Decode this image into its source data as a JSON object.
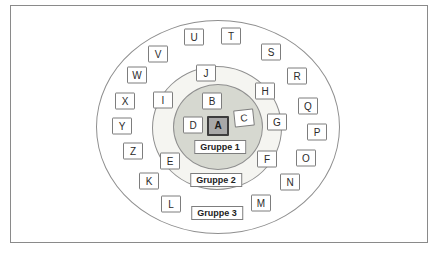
{
  "diagram": {
    "type": "concentric-group-diagram",
    "colors": {
      "page_background": "#ffffff",
      "frame_border": "#8a8a8a",
      "circle_stroke": "#8f8f8f",
      "node_border": "#7d7d7d",
      "node_fill": "#ffffff",
      "center_node_fill": "#a8a8a8",
      "center_node_border": "#3d3d3d",
      "inner_circle_fill": "#d6d8d0",
      "middle_circle_fill": "#f5f5f1",
      "outer_circle_fill": "#ffffff"
    },
    "circles": [
      {
        "name": "outer-ellipse",
        "cx": 218,
        "cy": 127,
        "rx": 122,
        "ry": 107,
        "fill": "#ffffff"
      },
      {
        "name": "middle-ellipse",
        "cx": 217,
        "cy": 128,
        "rx": 65,
        "ry": 62,
        "fill": "#f5f5f1"
      },
      {
        "name": "inner-ellipse",
        "cx": 218,
        "cy": 127,
        "rx": 45,
        "ry": 43,
        "fill": "#d6d8d0"
      }
    ],
    "nodes": [
      {
        "label": "A",
        "x": 218,
        "y": 126,
        "ring": 1,
        "variant": "center"
      },
      {
        "label": "B",
        "x": 212,
        "y": 101,
        "ring": 1,
        "variant": ""
      },
      {
        "label": "C",
        "x": 244,
        "y": 118,
        "ring": 1,
        "variant": "tilted"
      },
      {
        "label": "D",
        "x": 193,
        "y": 125,
        "ring": 1,
        "variant": ""
      },
      {
        "label": "E",
        "x": 170,
        "y": 161,
        "ring": 2,
        "variant": ""
      },
      {
        "label": "F",
        "x": 267,
        "y": 159,
        "ring": 2,
        "variant": ""
      },
      {
        "label": "G",
        "x": 277,
        "y": 122,
        "ring": 2,
        "variant": ""
      },
      {
        "label": "H",
        "x": 265,
        "y": 91,
        "ring": 2,
        "variant": ""
      },
      {
        "label": "I",
        "x": 163,
        "y": 100,
        "ring": 2,
        "variant": ""
      },
      {
        "label": "J",
        "x": 206,
        "y": 73,
        "ring": 2,
        "variant": ""
      },
      {
        "label": "K",
        "x": 149,
        "y": 181,
        "ring": 3,
        "variant": ""
      },
      {
        "label": "L",
        "x": 171,
        "y": 204,
        "ring": 3,
        "variant": ""
      },
      {
        "label": "M",
        "x": 261,
        "y": 203,
        "ring": 3,
        "variant": ""
      },
      {
        "label": "N",
        "x": 290,
        "y": 182,
        "ring": 3,
        "variant": ""
      },
      {
        "label": "O",
        "x": 306,
        "y": 158,
        "ring": 3,
        "variant": ""
      },
      {
        "label": "P",
        "x": 317,
        "y": 132,
        "ring": 3,
        "variant": ""
      },
      {
        "label": "Q",
        "x": 308,
        "y": 106,
        "ring": 3,
        "variant": ""
      },
      {
        "label": "R",
        "x": 297,
        "y": 76,
        "ring": 3,
        "variant": ""
      },
      {
        "label": "S",
        "x": 271,
        "y": 52,
        "ring": 3,
        "variant": ""
      },
      {
        "label": "T",
        "x": 231,
        "y": 36,
        "ring": 3,
        "variant": ""
      },
      {
        "label": "U",
        "x": 194,
        "y": 37,
        "ring": 3,
        "variant": ""
      },
      {
        "label": "V",
        "x": 158,
        "y": 54,
        "ring": 3,
        "variant": ""
      },
      {
        "label": "W",
        "x": 137,
        "y": 75,
        "ring": 3,
        "variant": ""
      },
      {
        "label": "X",
        "x": 125,
        "y": 101,
        "ring": 3,
        "variant": ""
      },
      {
        "label": "Y",
        "x": 122,
        "y": 126,
        "ring": 3,
        "variant": ""
      },
      {
        "label": "Z",
        "x": 133,
        "y": 151,
        "ring": 3,
        "variant": ""
      }
    ],
    "group_labels": [
      {
        "label": "Gruppe 1",
        "x": 220,
        "y": 147,
        "width": 49
      },
      {
        "label": "Gruppe 2",
        "x": 216,
        "y": 180,
        "width": 47
      },
      {
        "label": "Gruppe 3",
        "x": 217,
        "y": 213,
        "width": 49
      }
    ]
  }
}
